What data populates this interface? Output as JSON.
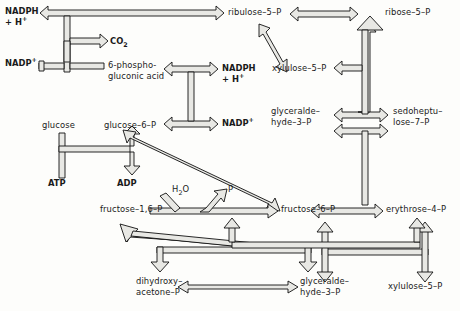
{
  "diagram": {
    "style": {
      "fill": "#e8e8e4",
      "stroke": "#111111",
      "background": "#fdfdfb",
      "text": "#1a1a1a"
    },
    "nodes": [
      {
        "id": "nadph_top",
        "label": "NADPH",
        "label2": "+ H",
        "sup2": "+",
        "bold": true,
        "x": 5,
        "y": 10,
        "align": "left"
      },
      {
        "id": "nadp_top",
        "label": "NADP",
        "sup": "+",
        "bold": true,
        "x": 5,
        "y": 60,
        "align": "left"
      },
      {
        "id": "co2",
        "label": "CO",
        "sub": "2",
        "bold": true,
        "x": 108,
        "y": 40,
        "align": "left"
      },
      {
        "id": "pg_acid",
        "label": "6-phospho-",
        "label2": "gluconic acid",
        "bold": false,
        "x": 108,
        "y": 63,
        "align": "left"
      },
      {
        "id": "ribulose5p",
        "label": "ribulose–5–P",
        "bold": false,
        "x": 228,
        "y": 10,
        "align": "left"
      },
      {
        "id": "ribose5p",
        "label": "ribose–5–P",
        "bold": false,
        "x": 363,
        "y": 10,
        "align": "left"
      },
      {
        "id": "xylulose5p_t",
        "label": "xylulose–5–P",
        "bold": false,
        "x": 282,
        "y": 68,
        "align": "left"
      },
      {
        "id": "nadph_mid",
        "label": "NADPH",
        "label2": "+ H",
        "sup2": "+",
        "bold": true,
        "x": 222,
        "y": 70,
        "align": "left"
      },
      {
        "id": "nadp_mid",
        "label": "NADP",
        "sup": "+",
        "bold": true,
        "x": 222,
        "y": 118,
        "align": "left"
      },
      {
        "id": "glyceraldehyde3p_mid",
        "label": "glyceralde–",
        "label2": "hyde–3–P",
        "bold": false,
        "x": 282,
        "y": 110,
        "align": "left"
      },
      {
        "id": "sedoheptulose7p",
        "label": "sedoheptu–",
        "label2": "lose–7–P",
        "bold": false,
        "x": 393,
        "y": 110,
        "align": "left"
      },
      {
        "id": "glucose",
        "label": "glucose",
        "bold": false,
        "x": 44,
        "y": 122,
        "align": "left"
      },
      {
        "id": "glucose6p",
        "label": "glucose–6–P",
        "bold": false,
        "x": 105,
        "y": 122,
        "align": "left"
      },
      {
        "id": "atp",
        "label": "ATP",
        "bold": true,
        "x": 49,
        "y": 180,
        "align": "left"
      },
      {
        "id": "adp",
        "label": "ADP",
        "bold": true,
        "x": 117,
        "y": 180,
        "align": "left"
      },
      {
        "id": "h2o",
        "label": "H",
        "sub": "2",
        "label_tail": "O",
        "bold": false,
        "x": 173,
        "y": 186,
        "align": "left"
      },
      {
        "id": "pi",
        "label": "P",
        "bold": false,
        "x": 228,
        "y": 186,
        "align": "left"
      },
      {
        "id": "fructose16p",
        "label": "fructose–1,6–P",
        "bold": false,
        "x": 101,
        "y": 208,
        "align": "left"
      },
      {
        "id": "fructose6p",
        "label": "fructose–6–P",
        "bold": false,
        "x": 281,
        "y": 208,
        "align": "left"
      },
      {
        "id": "erythrose4p",
        "label": "erythrose–4–P",
        "bold": false,
        "x": 388,
        "y": 208,
        "align": "left"
      },
      {
        "id": "dhap",
        "label": "dihydroxy–",
        "label2": "acetone–P",
        "bold": false,
        "x": 137,
        "y": 278,
        "align": "left"
      },
      {
        "id": "glyceraldehyde3p_btm",
        "label": "glyceralde–",
        "label2": "hyde–3–P",
        "bold": false,
        "x": 300,
        "y": 278,
        "align": "left"
      },
      {
        "id": "xylulose5p_b",
        "label": "xylulose–5–P",
        "bold": false,
        "x": 390,
        "y": 282,
        "align": "left"
      }
    ],
    "edges": [
      {
        "id": "g6p-to-ribulose5p",
        "from": "glucose-6-P",
        "to": "ribulose-5-P",
        "kind": "single"
      },
      {
        "id": "nadph-branch",
        "from": "oxidative-step",
        "to": "NADPH + H+",
        "kind": "single"
      },
      {
        "id": "nadp-branch",
        "from": "NADP+",
        "to": "oxidative-step",
        "kind": "single"
      },
      {
        "id": "co2-release",
        "from": "6-phosphogluconate",
        "to": "CO2",
        "kind": "single"
      },
      {
        "id": "ribulose5p-ribose5p",
        "from": "ribulose-5-P",
        "to": "ribose-5-P",
        "kind": "double"
      },
      {
        "id": "ribulose5p-xylulose5p",
        "from": "ribulose-5-P",
        "to": "xylulose-5-P",
        "kind": "double"
      },
      {
        "id": "g6p-oxidation",
        "from": "glucose-6-P",
        "to": "6-phosphogluconate",
        "kind": "double"
      },
      {
        "id": "glucose-g6p",
        "from": "glucose",
        "to": "glucose-6-P",
        "kind": "single"
      },
      {
        "id": "atp-adp",
        "from": "ATP",
        "to": "ADP",
        "kind": "single"
      },
      {
        "id": "f16p-f6p",
        "from": "fructose-1,6-P",
        "to": "fructose-6-P",
        "kind": "single"
      },
      {
        "id": "h2o-input",
        "from": "H2O",
        "to": "hydrolysis",
        "kind": "single"
      },
      {
        "id": "pi-output",
        "from": "hydrolysis",
        "to": "P",
        "kind": "single"
      },
      {
        "id": "g6p-f6p-diagonal",
        "from": "glucose-6-P",
        "to": "fructose-6-P",
        "kind": "double"
      },
      {
        "id": "triose-to-f16p",
        "from": "triose-phosphates",
        "to": "fructose-1,6-P",
        "kind": "single"
      },
      {
        "id": "f16p-to-dhap",
        "from": "fructose-1,6-P",
        "to": "dihydroxyacetone-P",
        "kind": "single"
      },
      {
        "id": "f16p-to-gap",
        "from": "fructose-1,6-P",
        "to": "glyceraldehyde-3-P",
        "kind": "single"
      },
      {
        "id": "dhap-gap",
        "from": "dihydroxyacetone-P",
        "to": "glyceraldehyde-3-P",
        "kind": "double"
      },
      {
        "id": "f6p-erythrose4p",
        "from": "fructose-6-P",
        "to": "erythrose-4-P",
        "kind": "double"
      },
      {
        "id": "gap-sedoheptulose",
        "from": "glyceraldehyde-3-P",
        "to": "sedoheptulose-7-P",
        "kind": "double"
      },
      {
        "id": "transketolase-vertical",
        "from": "sedoheptulose-step",
        "to": "ribose-5-P",
        "kind": "single"
      },
      {
        "id": "xylulose5p-branch",
        "from": "transketolase",
        "to": "xylulose-5-P",
        "kind": "single"
      },
      {
        "id": "gap-bottom-link",
        "from": "glyceraldehyde-3-P",
        "to": "transaldolase",
        "kind": "double"
      },
      {
        "id": "xylulose5p-bottom-link",
        "from": "xylulose-5-P",
        "to": "transketolase",
        "kind": "double"
      }
    ]
  }
}
